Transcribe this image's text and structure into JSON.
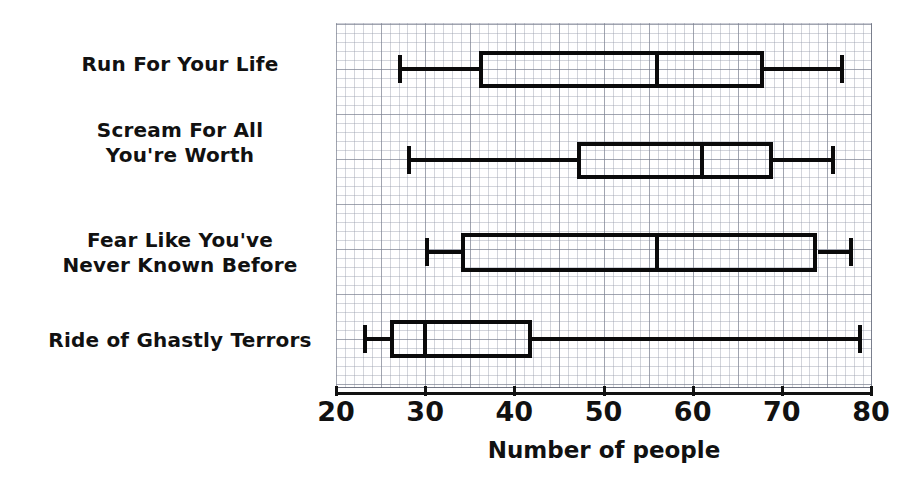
{
  "chart_data": {
    "type": "box",
    "title": "",
    "xlabel": "Number of people",
    "ylabel": "",
    "xlim": [
      20,
      80
    ],
    "xticks": [
      20,
      30,
      40,
      50,
      60,
      70,
      80
    ],
    "xtick_labels": [
      "20",
      "30",
      "40",
      "50",
      "60",
      "70",
      "80"
    ],
    "grid": true,
    "legend": "none",
    "orientation": "horizontal",
    "categories": [
      "Run For Your Life",
      "Scream For All\nYou're Worth",
      "Fear Like You've\nNever Known Before",
      "Ride of Ghastly Terrors"
    ],
    "boxes": [
      {
        "category": "Run For Your Life",
        "min": 27,
        "q1": 36,
        "median": 56,
        "q3": 68,
        "max": 77
      },
      {
        "category": "Scream For All You're Worth",
        "min": 28,
        "q1": 47,
        "median": 61,
        "q3": 69,
        "max": 76
      },
      {
        "category": "Fear Like You've Never Known Before",
        "min": 30,
        "q1": 34,
        "median": 56,
        "q3": 74,
        "max": 78
      },
      {
        "category": "Ride of Ghastly Terrors",
        "min": 23,
        "q1": 26,
        "median": 30,
        "q3": 42,
        "max": 79
      }
    ],
    "colors": {
      "line": "#0a0a0a",
      "grid_minor": "#969baa",
      "grid_major": "#787d8c",
      "background": "#ffffff",
      "text": "#111111"
    }
  }
}
